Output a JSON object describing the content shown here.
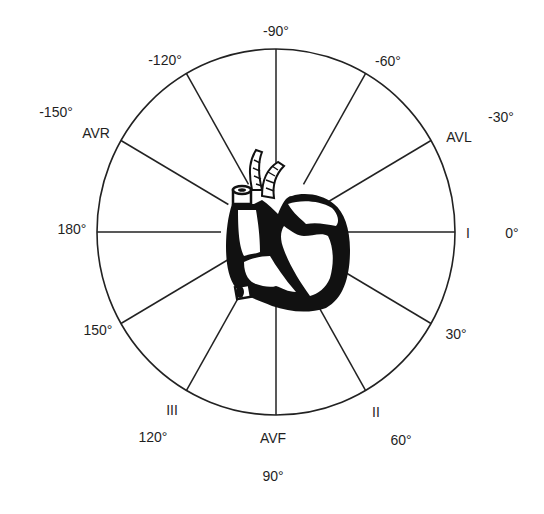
{
  "diagram": {
    "center": {
      "x": 276,
      "y": 232
    },
    "radius": {
      "rx": 179,
      "ry": 183
    },
    "stroke_color": "#222222",
    "heart_color": "#111111",
    "spokes": [
      {
        "angle": 0,
        "lead": "I"
      },
      {
        "angle": 30,
        "lead": ""
      },
      {
        "angle": 60,
        "lead": "II"
      },
      {
        "angle": 90,
        "lead": "AVF"
      },
      {
        "angle": 120,
        "lead": "III"
      },
      {
        "angle": 150,
        "lead": ""
      },
      {
        "angle": 180,
        "lead": ""
      },
      {
        "angle": -150,
        "lead": "AVR"
      },
      {
        "angle": -120,
        "lead": ""
      },
      {
        "angle": -90,
        "lead": ""
      },
      {
        "angle": -60,
        "lead": ""
      },
      {
        "angle": -30,
        "lead": "AVL"
      }
    ],
    "labels": {
      "deg_m90": {
        "text": "-90°",
        "x": 276,
        "y": 31
      },
      "deg_m120": {
        "text": "-120°",
        "x": 165,
        "y": 60
      },
      "deg_m60": {
        "text": "-60°",
        "x": 388,
        "y": 61
      },
      "deg_m150": {
        "text": "-150°",
        "x": 56,
        "y": 112
      },
      "lead_avr": {
        "text": "AVR",
        "x": 96,
        "y": 133
      },
      "deg_m30": {
        "text": "-30°",
        "x": 501,
        "y": 117
      },
      "lead_avl": {
        "text": "AVL",
        "x": 459,
        "y": 137
      },
      "deg_180": {
        "text": "180°",
        "x": 72,
        "y": 229
      },
      "lead_i": {
        "text": "I",
        "x": 468,
        "y": 233
      },
      "deg_0": {
        "text": "0°",
        "x": 512,
        "y": 233
      },
      "deg_150": {
        "text": "150°",
        "x": 98,
        "y": 330
      },
      "deg_30": {
        "text": "30°",
        "x": 456,
        "y": 334
      },
      "lead_iii": {
        "text": "III",
        "x": 172,
        "y": 410
      },
      "lead_ii": {
        "text": "II",
        "x": 376,
        "y": 412
      },
      "deg_120": {
        "text": "120°",
        "x": 153,
        "y": 437
      },
      "lead_avf": {
        "text": "AVF",
        "x": 273,
        "y": 438
      },
      "deg_60": {
        "text": "60°",
        "x": 401,
        "y": 440
      },
      "deg_90": {
        "text": "90°",
        "x": 273,
        "y": 476
      }
    }
  }
}
